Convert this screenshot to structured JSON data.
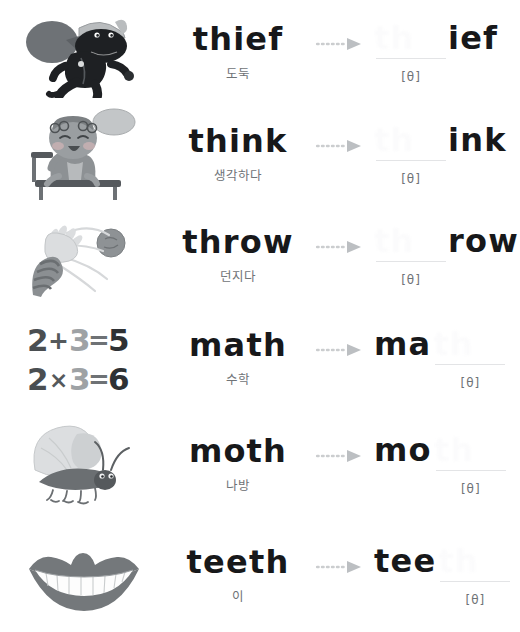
{
  "worksheet": {
    "phoneme": "[θ]",
    "arrow_icon": "dotted-arrow-right-icon",
    "text_color": "#17181a",
    "muted_color": "#6f7377",
    "rule_color": "#e3e4e6",
    "background": "#ffffff"
  },
  "rows": [
    {
      "word": "thief",
      "korean": "도둑",
      "illustration": "running-thief-with-sack-illustration",
      "blank_text": "th",
      "blank_position": "left",
      "fragment": "ief",
      "phonetic": "[θ]"
    },
    {
      "word": "think",
      "korean": "생각하다",
      "illustration": "child-on-bench-with-thought-bubble-illustration",
      "blank_text": "th",
      "blank_position": "left",
      "fragment": "ink",
      "phonetic": "[θ]"
    },
    {
      "word": "throw",
      "korean": "던지다",
      "illustration": "arm-throwing-ball-illustration",
      "blank_text": "th",
      "blank_position": "left",
      "fragment": "row",
      "phonetic": "[θ]"
    },
    {
      "word": "math",
      "korean": "수학",
      "illustration": "math-equations-illustration",
      "blank_text": "th",
      "blank_position": "right",
      "fragment": "ma",
      "phonetic": "[θ]",
      "equations": [
        "2 + 3 = 5",
        "2 × 3 = 6"
      ]
    },
    {
      "word": "moth",
      "korean": "나방",
      "illustration": "moth-illustration",
      "blank_text": "th",
      "blank_position": "right",
      "fragment": "mo",
      "phonetic": "[θ]"
    },
    {
      "word": "teeth",
      "korean": "이",
      "illustration": "smiling-mouth-with-teeth-illustration",
      "blank_text": "th",
      "blank_position": "right",
      "fragment": "tee",
      "phonetic": "[θ]"
    }
  ]
}
